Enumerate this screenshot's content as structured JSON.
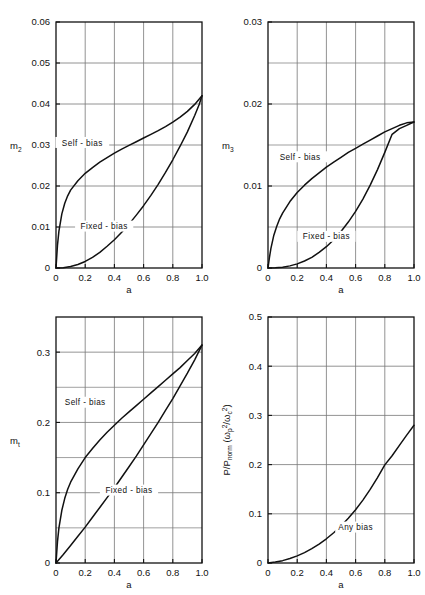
{
  "figure": {
    "background": "#ffffff",
    "ink": "#111111",
    "gridcolor": "#777777",
    "layout": "2x2 grid of xy line plots"
  },
  "chart_data": [
    {
      "id": "m2",
      "type": "line",
      "title": "",
      "xlabel": "a",
      "ylabel": "m",
      "ylabel_sub": "2",
      "xlim": [
        0,
        1.0
      ],
      "ylim": [
        0,
        0.06
      ],
      "xticks": [
        0,
        0.2,
        0.4,
        0.6,
        0.8,
        1.0
      ],
      "xticklabels": [
        "0",
        "0.2",
        "0.4",
        "0.6",
        "0.8",
        "1.0"
      ],
      "yticks": [
        0,
        0.01,
        0.02,
        0.03,
        0.04,
        0.05,
        0.06
      ],
      "yticklabels": [
        "0",
        "0.01",
        "0.02",
        "0.03",
        "0.04",
        "0.05",
        "0.06"
      ],
      "grid": true,
      "grid_minor_y": false,
      "legend": "inline curve annotations",
      "series": [
        {
          "name": "Self - bias",
          "label_x": 0.18,
          "label_y": 0.0305,
          "x": [
            0,
            0.01,
            0.02,
            0.04,
            0.06,
            0.08,
            0.1,
            0.15,
            0.2,
            0.25,
            0.3,
            0.35,
            0.4,
            0.45,
            0.5,
            0.55,
            0.6,
            0.65,
            0.7,
            0.75,
            0.8,
            0.85,
            0.9,
            0.95,
            1.0
          ],
          "y": [
            0,
            0.0055,
            0.009,
            0.0132,
            0.0158,
            0.0176,
            0.019,
            0.0213,
            0.0231,
            0.0245,
            0.0258,
            0.0269,
            0.028,
            0.029,
            0.0299,
            0.0308,
            0.0317,
            0.0326,
            0.0335,
            0.0345,
            0.0356,
            0.0368,
            0.0382,
            0.0399,
            0.042
          ]
        },
        {
          "name": "Fixed - bias",
          "label_x": 0.33,
          "label_y": 0.0101,
          "x": [
            0,
            0.05,
            0.1,
            0.15,
            0.2,
            0.25,
            0.3,
            0.35,
            0.4,
            0.45,
            0.5,
            0.55,
            0.6,
            0.65,
            0.7,
            0.75,
            0.8,
            0.85,
            0.9,
            0.95,
            0.98,
            1.0
          ],
          "y": [
            0,
            8e-05,
            0.00035,
            0.00085,
            0.0016,
            0.0026,
            0.0038,
            0.0053,
            0.0069,
            0.0087,
            0.0107,
            0.0129,
            0.0152,
            0.0177,
            0.0204,
            0.0233,
            0.0264,
            0.0297,
            0.0332,
            0.0372,
            0.0398,
            0.042
          ]
        }
      ]
    },
    {
      "id": "m3",
      "type": "line",
      "title": "",
      "xlabel": "a",
      "ylabel": "m",
      "ylabel_sub": "3",
      "xlim": [
        0,
        1.0
      ],
      "ylim": [
        0,
        0.03
      ],
      "xticks": [
        0,
        0.2,
        0.4,
        0.6,
        0.8,
        1.0
      ],
      "xticklabels": [
        "0",
        "0.2",
        "0.4",
        "0.6",
        "0.8",
        "1.0"
      ],
      "yticks": [
        0,
        0.01,
        0.02,
        0.03
      ],
      "yticklabels": [
        "0",
        "0.01",
        "0.02",
        "0.03"
      ],
      "yminor": [
        0.005,
        0.015,
        0.025
      ],
      "grid": true,
      "grid_minor_y": true,
      "legend": "inline curve annotations",
      "series": [
        {
          "name": "Self - bias",
          "label_x": 0.22,
          "label_y": 0.0135,
          "x": [
            0,
            0.01,
            0.02,
            0.04,
            0.06,
            0.08,
            0.1,
            0.15,
            0.2,
            0.25,
            0.3,
            0.35,
            0.4,
            0.45,
            0.5,
            0.55,
            0.6,
            0.65,
            0.7,
            0.75,
            0.8,
            0.85,
            0.9,
            0.95,
            1.0
          ],
          "y": [
            0,
            0.0013,
            0.0024,
            0.004,
            0.0051,
            0.006,
            0.0067,
            0.0081,
            0.0092,
            0.0101,
            0.0109,
            0.0116,
            0.0123,
            0.0129,
            0.0135,
            0.0141,
            0.0146,
            0.0151,
            0.0156,
            0.0161,
            0.0166,
            0.017,
            0.0174,
            0.0177,
            0.0178
          ]
        },
        {
          "name": "Fixed - bias",
          "label_x": 0.4,
          "label_y": 0.0038,
          "x": [
            0,
            0.05,
            0.1,
            0.15,
            0.2,
            0.25,
            0.3,
            0.35,
            0.4,
            0.45,
            0.5,
            0.55,
            0.6,
            0.65,
            0.7,
            0.75,
            0.8,
            0.85,
            0.9,
            0.95,
            0.98,
            1.0
          ],
          "y": [
            0,
            2e-05,
            0.0001,
            0.00026,
            0.0005,
            0.00085,
            0.0013,
            0.0019,
            0.0026,
            0.00345,
            0.00445,
            0.0056,
            0.0069,
            0.0084,
            0.0101,
            0.012,
            0.0141,
            0.0163,
            0.017,
            0.0174,
            0.01765,
            0.0178
          ]
        }
      ]
    },
    {
      "id": "mt",
      "type": "line",
      "title": "",
      "xlabel": "a",
      "ylabel": "m",
      "ylabel_sub": "t",
      "xlim": [
        0,
        1.0
      ],
      "ylim": [
        0,
        0.35
      ],
      "xticks": [
        0,
        0.2,
        0.4,
        0.6,
        0.8,
        1.0
      ],
      "xticklabels": [
        "0",
        "0.2",
        "0.4",
        "0.6",
        "0.8",
        "1.0"
      ],
      "yticks": [
        0,
        0.1,
        0.2,
        0.3
      ],
      "yticklabels": [
        "0",
        "0.1",
        "0.2",
        "0.3"
      ],
      "yminor": [
        0.05,
        0.15,
        0.25
      ],
      "grid": true,
      "grid_minor_y": true,
      "legend": "inline curve annotations",
      "series": [
        {
          "name": "Self - bias",
          "label_x": 0.2,
          "label_y": 0.228,
          "x": [
            0,
            0.01,
            0.02,
            0.04,
            0.06,
            0.08,
            0.1,
            0.15,
            0.2,
            0.25,
            0.3,
            0.35,
            0.4,
            0.45,
            0.5,
            0.55,
            0.6,
            0.65,
            0.7,
            0.75,
            0.8,
            0.85,
            0.9,
            0.95,
            1.0
          ],
          "y": [
            0,
            0.03,
            0.05,
            0.075,
            0.092,
            0.105,
            0.115,
            0.134,
            0.15,
            0.163,
            0.175,
            0.186,
            0.196,
            0.206,
            0.215,
            0.224,
            0.233,
            0.242,
            0.251,
            0.26,
            0.269,
            0.278,
            0.288,
            0.298,
            0.31
          ]
        },
        {
          "name": "Fixed - bias",
          "label_x": 0.5,
          "label_y": 0.103,
          "x": [
            0,
            0.05,
            0.1,
            0.15,
            0.2,
            0.25,
            0.3,
            0.35,
            0.4,
            0.45,
            0.5,
            0.55,
            0.6,
            0.65,
            0.7,
            0.75,
            0.8,
            0.85,
            0.9,
            0.95,
            1.0
          ],
          "y": [
            0,
            0.012,
            0.025,
            0.038,
            0.051,
            0.065,
            0.079,
            0.093,
            0.107,
            0.122,
            0.137,
            0.152,
            0.168,
            0.184,
            0.2,
            0.217,
            0.234,
            0.252,
            0.27,
            0.289,
            0.31
          ]
        }
      ]
    },
    {
      "id": "power",
      "type": "line",
      "title": "",
      "xlabel": "a",
      "ylabel": "P/P_norm ( wp^2 / wc^2 )",
      "xlim": [
        0,
        1.0
      ],
      "ylim": [
        0,
        0.5
      ],
      "xticks": [
        0,
        0.2,
        0.4,
        0.6,
        0.8,
        1.0
      ],
      "xticklabels": [
        "0",
        "0.2",
        "0.4",
        "0.6",
        "0.8",
        "1.0"
      ],
      "yticks": [
        0,
        0.1,
        0.2,
        0.3,
        0.4,
        0.5
      ],
      "yticklabels": [
        "0",
        "0.1",
        "0.2",
        "0.3",
        "0.4",
        "0.5"
      ],
      "grid": true,
      "grid_minor_y": false,
      "legend": "inline curve annotation",
      "series": [
        {
          "name": "Any bias",
          "label_x": 0.6,
          "label_y": 0.072,
          "x": [
            0,
            0.05,
            0.1,
            0.15,
            0.2,
            0.25,
            0.3,
            0.35,
            0.4,
            0.45,
            0.5,
            0.55,
            0.6,
            0.65,
            0.7,
            0.75,
            0.8,
            0.85,
            0.9,
            0.95,
            1.0
          ],
          "y": [
            0,
            0.0018,
            0.0048,
            0.009,
            0.0145,
            0.0212,
            0.0292,
            0.0385,
            0.0492,
            0.0614,
            0.0752,
            0.0908,
            0.1082,
            0.1278,
            0.1495,
            0.1735,
            0.1995,
            0.218,
            0.239,
            0.26,
            0.28
          ]
        }
      ]
    }
  ],
  "labels": {
    "x_axis": "a",
    "m2": "m",
    "m2_sub": "2",
    "m3": "m",
    "m3_sub": "3",
    "mt": "m",
    "mt_sub": "t",
    "power_prefix": "P/P",
    "power_sub": "norm",
    "power_open": "(",
    "power_omega": "ω",
    "power_p_sub": "p",
    "power_sq": "2",
    "power_slash": "/",
    "power_omega2": "ω",
    "power_c_sub": "c",
    "power_sq2": "2",
    "power_close": ")",
    "self_bias": "Self – bias",
    "fixed_bias": "Fixed – bias",
    "any_bias": "Any bias"
  }
}
